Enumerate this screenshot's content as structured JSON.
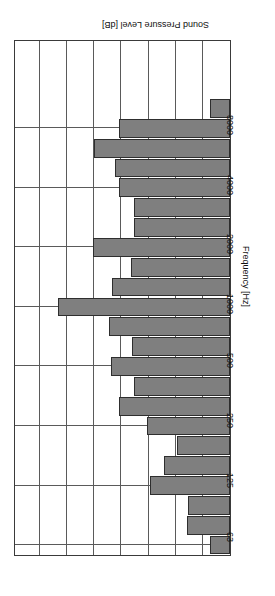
{
  "chart_data": {
    "type": "bar",
    "orientation": "horizontal",
    "title": "",
    "xlabel": "Sound Pressure Level [dB]",
    "ylabel": "Frequency [Hz]",
    "grid": true,
    "legend": null,
    "rotation_deg": 180,
    "value_axis": {
      "label": "Sound Pressure Level [dB]",
      "ticks": [
        0,
        1,
        2,
        3,
        4,
        5,
        6,
        7,
        8
      ],
      "tick_labels": [
        "",
        "",
        "",
        "",
        "",
        "",
        "",
        "",
        ""
      ],
      "range": [
        0,
        8
      ],
      "note": "value axis gridlines unlabelled in scan; 8 equal divisions"
    },
    "category_axis": {
      "label": "Frequency [Hz]",
      "labelled_ticks": [
        63,
        125,
        250,
        500,
        1000,
        2000,
        4000,
        8000
      ],
      "type": "third-octave-bands"
    },
    "categories": [
      "63",
      "80",
      "100",
      "125",
      "160",
      "200",
      "250",
      "315",
      "400",
      "500",
      "630",
      "800",
      "1000",
      "1250",
      "1600",
      "2000",
      "2500",
      "3150",
      "4000",
      "5000",
      "6300",
      "8000",
      "10000",
      "12500",
      "16000",
      "20000"
    ],
    "values": [
      0.72,
      1.6,
      1.55,
      2.95,
      2.45,
      1.95,
      3.05,
      4.1,
      3.55,
      4.4,
      3.6,
      4.45,
      6.35,
      4.35,
      3.65,
      5.05,
      3.55,
      3.55,
      4.1,
      4.25,
      5.0,
      4.1,
      0.72,
      0.0,
      0.0,
      0.0
    ],
    "bar_color": "#7f7f7f",
    "bar_edge_color": "#2e2e2e",
    "grid_color": "#5a5a5a",
    "frame_color": "#3a3a3a"
  },
  "axis": {
    "frequency_title": "Frequency [Hz]",
    "level_title": "Sound Pressure Level [dB]",
    "frequency_ticks": [
      "8000",
      "4000",
      "2000",
      "1000",
      "500",
      "250",
      "125",
      "63"
    ]
  }
}
